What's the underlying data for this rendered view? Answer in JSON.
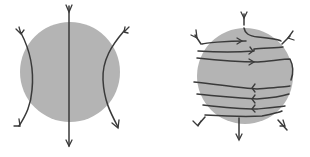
{
  "figure": {
    "panels": [
      {
        "id": "left",
        "description": "field lines passing through sphere",
        "sphere_color": "#b4b4b4",
        "line_color": "#3a3a3a"
      },
      {
        "id": "right",
        "description": "field lines wrapping around sphere",
        "sphere_color": "#b4b4b4",
        "line_color": "#3a3a3a"
      }
    ]
  }
}
